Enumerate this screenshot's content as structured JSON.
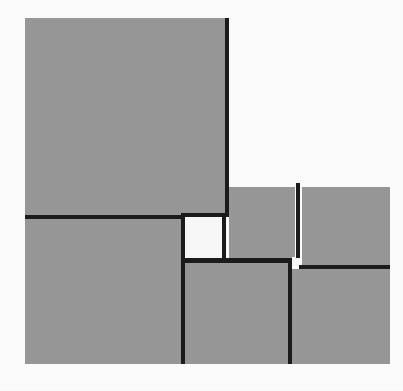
{
  "figure": {
    "title": "Squared rectangle dissection",
    "caption": "A rectangle subdivided into squares of differing sizes, drawn with thick black dividing lines on a white ground.",
    "canvas": {
      "width": 403,
      "height": 391
    },
    "colors": {
      "background": "#ffffff",
      "fill_gray": "#999999",
      "fill_white": "#fbfbfb",
      "line": "#1c1c1c"
    },
    "bounds": {
      "left": 25,
      "top": 18,
      "right": 390,
      "bottom": 364
    },
    "line_weight": 4
  },
  "tiles": [
    {
      "name": "square-top-left",
      "fill": "gray",
      "x": 25,
      "y": 18,
      "w": 200,
      "h": 197,
      "label": "Large upper-left square"
    },
    {
      "name": "square-top-right",
      "fill": "blank",
      "x": 229,
      "y": 18,
      "w": 161,
      "h": 165,
      "label": "Upper-right blank square"
    },
    {
      "name": "square-right-upper-left",
      "fill": "gray",
      "x": 229,
      "y": 187,
      "w": 66,
      "h": 71,
      "label": "Right-side upper-left square"
    },
    {
      "name": "square-right-upper-right",
      "fill": "gray",
      "x": 302,
      "y": 187,
      "w": 88,
      "h": 78,
      "label": "Right-side upper-right square"
    },
    {
      "name": "square-center-white",
      "fill": "white",
      "x": 185,
      "y": 217,
      "w": 37,
      "h": 41,
      "label": "Central white square"
    },
    {
      "name": "square-tiny-white",
      "fill": "white",
      "x": 292,
      "y": 257,
      "w": 8,
      "h": 9,
      "label": "Smallest white square"
    },
    {
      "name": "square-bottom-left",
      "fill": "gray",
      "x": 25,
      "y": 219,
      "w": 156,
      "h": 145,
      "label": "Lower-left square"
    },
    {
      "name": "square-bottom-center",
      "fill": "gray",
      "x": 185,
      "y": 263,
      "w": 103,
      "h": 101,
      "label": "Lower-centre square"
    },
    {
      "name": "square-bottom-right",
      "fill": "gray",
      "x": 292,
      "y": 269,
      "w": 98,
      "h": 95,
      "label": "Lower-right square"
    }
  ],
  "rules": [
    {
      "name": "rule-vertical-top-main",
      "orientation": "vertical",
      "x": 225,
      "y": 18,
      "w": 4,
      "h": 199
    },
    {
      "name": "rule-horizontal-left-mid",
      "orientation": "horizontal",
      "x": 25,
      "y": 215,
      "w": 160,
      "h": 4
    },
    {
      "name": "rule-horizontal-white-top",
      "orientation": "horizontal",
      "x": 181,
      "y": 213,
      "w": 48,
      "h": 4
    },
    {
      "name": "rule-vertical-white-left",
      "orientation": "vertical",
      "x": 181,
      "y": 213,
      "w": 4,
      "h": 151
    },
    {
      "name": "rule-vertical-white-right",
      "orientation": "vertical",
      "x": 222,
      "y": 215,
      "w": 4,
      "h": 48
    },
    {
      "name": "rule-horizontal-white-bot",
      "orientation": "horizontal",
      "x": 181,
      "y": 258,
      "w": 111,
      "h": 5
    },
    {
      "name": "rule-vertical-right-split",
      "orientation": "vertical",
      "x": 296,
      "y": 183,
      "w": 4,
      "h": 75
    },
    {
      "name": "rule-vertical-bottom-mid",
      "orientation": "vertical",
      "x": 288,
      "y": 258,
      "w": 4,
      "h": 106
    },
    {
      "name": "rule-horizontal-bottom-rt",
      "orientation": "horizontal",
      "x": 299,
      "y": 265,
      "w": 91,
      "h": 4
    }
  ]
}
